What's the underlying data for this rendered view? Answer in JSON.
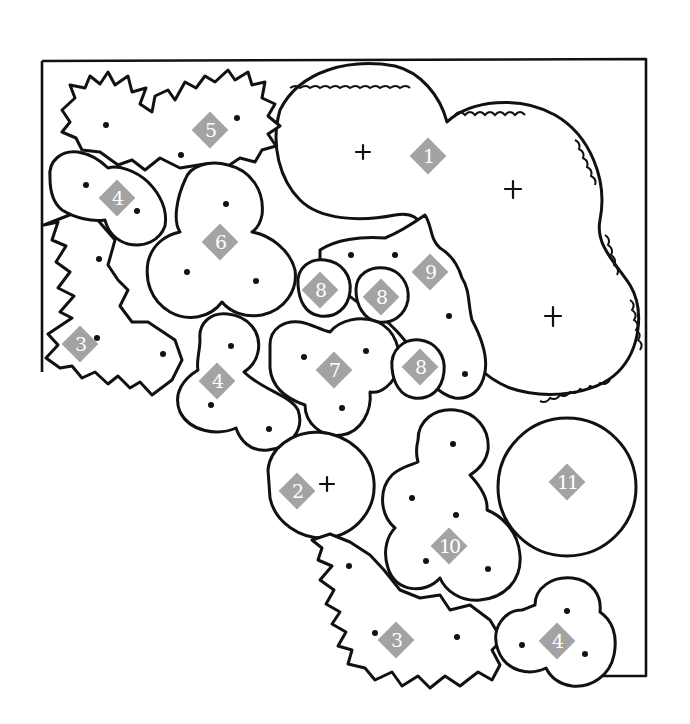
{
  "diagram": {
    "type": "garden-planting-plan",
    "colors": {
      "outline": "#111111",
      "marker_fill": "#a3a3a3",
      "marker_text": "#ffffff",
      "background": "#ffffff"
    },
    "markers": [
      {
        "id": "m1",
        "label": "1",
        "x": 428,
        "y": 156
      },
      {
        "id": "m2",
        "label": "2",
        "x": 297,
        "y": 491
      },
      {
        "id": "m3a",
        "label": "3",
        "x": 80,
        "y": 344
      },
      {
        "id": "m3b",
        "label": "3",
        "x": 396,
        "y": 640
      },
      {
        "id": "m4a",
        "label": "4",
        "x": 117,
        "y": 198
      },
      {
        "id": "m4b",
        "label": "4",
        "x": 217,
        "y": 381
      },
      {
        "id": "m4c",
        "label": "4",
        "x": 557,
        "y": 641
      },
      {
        "id": "m5",
        "label": "5",
        "x": 210,
        "y": 130
      },
      {
        "id": "m6",
        "label": "6",
        "x": 220,
        "y": 242
      },
      {
        "id": "m7",
        "label": "7",
        "x": 334,
        "y": 370
      },
      {
        "id": "m8a",
        "label": "8",
        "x": 320,
        "y": 290
      },
      {
        "id": "m8b",
        "label": "8",
        "x": 381,
        "y": 297
      },
      {
        "id": "m8c",
        "label": "8",
        "x": 420,
        "y": 367
      },
      {
        "id": "m9",
        "label": "9",
        "x": 430,
        "y": 272
      },
      {
        "id": "m10",
        "label": "10",
        "x": 449,
        "y": 546
      },
      {
        "id": "m11",
        "label": "11",
        "x": 567,
        "y": 482
      }
    ],
    "legend_groups": [
      {
        "label": "1",
        "symbol": "cross-tree",
        "count": 3
      },
      {
        "label": "2",
        "symbol": "cross-tree",
        "count": 1
      },
      {
        "label": "3",
        "symbol": "spiky-shrub",
        "count": 2
      },
      {
        "label": "4",
        "symbol": "scalloped-shrub",
        "count": 3
      },
      {
        "label": "5",
        "symbol": "spiky-shrub",
        "count": 1
      },
      {
        "label": "6",
        "symbol": "scalloped-shrub",
        "count": 1
      },
      {
        "label": "7",
        "symbol": "scalloped-shrub",
        "count": 1
      },
      {
        "label": "8",
        "symbol": "scalloped-shrub",
        "count": 3
      },
      {
        "label": "9",
        "symbol": "frilly-groundcover",
        "count": 1
      },
      {
        "label": "10",
        "symbol": "scalloped-shrub",
        "count": 1
      },
      {
        "label": "11",
        "symbol": "circle-feature",
        "count": 1
      }
    ]
  }
}
